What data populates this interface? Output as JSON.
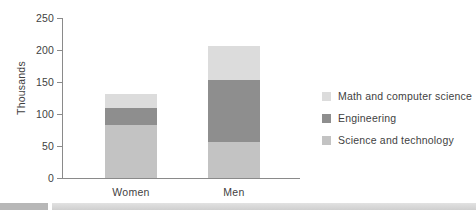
{
  "chart_data": {
    "type": "bar",
    "title": "",
    "subtitle": "",
    "xlabel": "",
    "ylabel": "Thousands",
    "categories": [
      "Women",
      "Men"
    ],
    "ylim": [
      0,
      250
    ],
    "yticks": [
      0,
      50,
      100,
      150,
      200,
      250
    ],
    "grid": false,
    "stacked": true,
    "legend_position": "right",
    "series": [
      {
        "name": "Science and technology",
        "color": "#c3c3c3",
        "values": [
          83,
          56
        ]
      },
      {
        "name": "Engineering",
        "color": "#8e8e8e",
        "values": [
          26,
          97
        ]
      },
      {
        "name": "Math and computer science",
        "color": "#dcdcdc",
        "values": [
          22,
          54
        ]
      }
    ],
    "totals": [
      131,
      207
    ]
  },
  "axis": {
    "y_title": "Thousands",
    "y_ticks": [
      {
        "label": "250",
        "value": 250
      },
      {
        "label": "200",
        "value": 200
      },
      {
        "label": "150",
        "value": 150
      },
      {
        "label": "100",
        "value": 100
      },
      {
        "label": "50",
        "value": 50
      },
      {
        "label": "0",
        "value": 0
      }
    ],
    "x_ticks": [
      {
        "label": "Women"
      },
      {
        "label": "Men"
      }
    ]
  },
  "legend": {
    "items": [
      {
        "label": "Math and computer science",
        "color": "#dcdcdc"
      },
      {
        "label": "Engineering",
        "color": "#8e8e8e"
      },
      {
        "label": "Science and technology",
        "color": "#c3c3c3"
      }
    ]
  },
  "colors": {
    "axis": "#8a8a8a",
    "text": "#3f3f3f",
    "background": "#ffffff",
    "footer_block": "#b7b7b7",
    "footer_rule": "#d8d8d8"
  }
}
